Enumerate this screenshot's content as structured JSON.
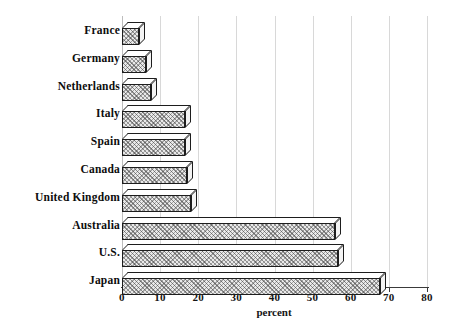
{
  "chart_data": {
    "type": "bar",
    "orientation": "horizontal",
    "title": "",
    "xlabel": "percent",
    "ylabel": "",
    "xlim": [
      0,
      80
    ],
    "xticks": [
      0,
      10,
      20,
      30,
      40,
      50,
      60,
      70,
      80
    ],
    "grid": true,
    "legend": false,
    "categories": [
      "France",
      "Germany",
      "Netherlands",
      "Italy",
      "Spain",
      "Canada",
      "United Kingdom",
      "Australia",
      "U.S.",
      "Japan"
    ],
    "values": [
      4.5,
      6.2,
      7.5,
      16.4,
      16.4,
      17.1,
      18.2,
      55.8,
      56.6,
      67.8
    ],
    "bar_style": {
      "fill": "#e9e9e9",
      "hatch": "crosshatch",
      "edge": "#1d1d1d",
      "three_d": true
    }
  },
  "axis": {
    "tick_labels": [
      "0",
      "10",
      "20",
      "30",
      "40",
      "50",
      "60",
      "70",
      "80"
    ],
    "x_title": "percent"
  },
  "colors": {
    "background": "#ffffff",
    "gridline": "#d8d8d8",
    "axis": "#3a3a3a",
    "text": "#0d0d0d"
  }
}
